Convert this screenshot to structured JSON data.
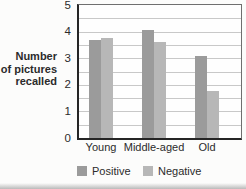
{
  "chart_data": {
    "type": "bar",
    "title": "",
    "ylabel": "Number of pictures recalled",
    "ylabel_lines": [
      "Number",
      "of pictures",
      "recalled"
    ],
    "categories": [
      "Young",
      "Middle-aged",
      "Old"
    ],
    "series": [
      {
        "name": "Positive",
        "color": "#9b9b9b",
        "values": [
          3.7,
          4.05,
          3.1
        ]
      },
      {
        "name": "Negative",
        "color": "#b7b7b7",
        "values": [
          3.75,
          3.6,
          1.75
        ]
      }
    ],
    "ylim": [
      0,
      5
    ],
    "yticks": [
      "0",
      "1",
      "2",
      "3",
      "4",
      "5"
    ],
    "minor_grid_step": 0.5,
    "grid": true,
    "legend_position": "bottom",
    "axis_color": "#252525",
    "grid_color": "#c8c8c8",
    "text_color": "#2b2b2b"
  }
}
